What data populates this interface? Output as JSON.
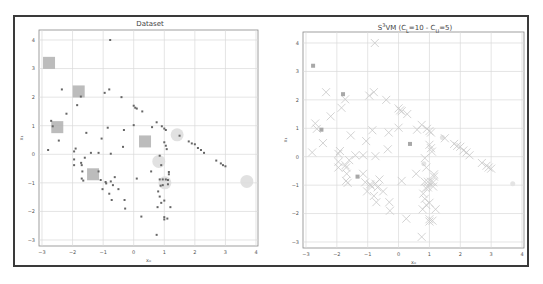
{
  "figure": {
    "frame_color": "#3a3a3a",
    "grid_color": "#d8d8d8",
    "axes_color": "#888888"
  },
  "chart_data": [
    {
      "type": "scatter",
      "title": "Dataset",
      "xlabel": "x₀",
      "ylabel": "x₁",
      "xlim": [
        -3.1,
        4.1
      ],
      "ylim": [
        -3.2,
        4.3
      ],
      "xticks": [
        -3,
        -2,
        -1,
        0,
        1,
        2,
        3,
        4
      ],
      "yticks": [
        -3,
        -2,
        -1,
        0,
        1,
        2,
        3,
        4
      ],
      "grid": true,
      "series": [
        {
          "name": "unlabeled",
          "marker": "small-dot",
          "color": "#666666",
          "points": [
            [
              -0.77,
              4.0
            ],
            [
              -2.35,
              2.27
            ],
            [
              -1.73,
              2.02
            ],
            [
              -0.95,
              2.15
            ],
            [
              -0.8,
              2.27
            ],
            [
              -0.4,
              2.0
            ],
            [
              -1.85,
              1.72
            ],
            [
              -2.2,
              1.42
            ],
            [
              -2.7,
              1.17
            ],
            [
              -2.65,
              0.98
            ],
            [
              -0.85,
              0.93
            ],
            [
              0.0,
              1.02
            ],
            [
              0.0,
              1.7
            ],
            [
              0.05,
              1.63
            ],
            [
              0.1,
              1.6
            ],
            [
              0.28,
              1.5
            ],
            [
              0.6,
              0.95
            ],
            [
              0.75,
              1.12
            ],
            [
              0.92,
              0.98
            ],
            [
              1.0,
              0.9
            ],
            [
              1.05,
              0.85
            ],
            [
              1.5,
              0.65
            ],
            [
              1.8,
              0.45
            ],
            [
              1.9,
              0.38
            ],
            [
              2.0,
              0.35
            ],
            [
              2.1,
              0.22
            ],
            [
              2.2,
              0.15
            ],
            [
              2.3,
              0.05
            ],
            [
              2.7,
              -0.22
            ],
            [
              2.85,
              -0.32
            ],
            [
              2.92,
              -0.38
            ],
            [
              3.0,
              -0.42
            ],
            [
              -2.45,
              0.48
            ],
            [
              -1.55,
              0.75
            ],
            [
              -1.05,
              0.55
            ],
            [
              -0.32,
              0.85
            ],
            [
              -0.35,
              0.26
            ],
            [
              -1.9,
              0.2
            ],
            [
              -1.95,
              0.1
            ],
            [
              -1.4,
              0.05
            ],
            [
              -1.15,
              0.05
            ],
            [
              -0.75,
              0.02
            ],
            [
              -1.6,
              -0.12
            ],
            [
              -1.95,
              -0.18
            ],
            [
              -1.95,
              -0.38
            ],
            [
              -1.72,
              -0.3
            ],
            [
              -1.7,
              -0.38
            ],
            [
              -1.68,
              -0.6
            ],
            [
              -1.15,
              -0.6
            ],
            [
              -1.08,
              -0.9
            ],
            [
              -1.7,
              -0.85
            ],
            [
              -1.65,
              -0.92
            ],
            [
              -0.92,
              -0.97
            ],
            [
              -0.9,
              -1.02
            ],
            [
              -0.75,
              -0.95
            ],
            [
              -0.68,
              -1.08
            ],
            [
              -0.62,
              -0.8
            ],
            [
              -0.5,
              -1.22
            ],
            [
              -1.02,
              -1.22
            ],
            [
              -0.8,
              -1.38
            ],
            [
              -0.72,
              -1.6
            ],
            [
              -0.3,
              -1.6
            ],
            [
              -0.28,
              -1.9
            ],
            [
              0.1,
              -0.85
            ],
            [
              0.57,
              -0.6
            ],
            [
              0.85,
              -0.05
            ],
            [
              0.9,
              -0.38
            ],
            [
              1.0,
              0.42
            ],
            [
              1.05,
              0.3
            ],
            [
              1.08,
              0.18
            ],
            [
              0.85,
              -0.88
            ],
            [
              0.95,
              -0.88
            ],
            [
              1.05,
              -0.88
            ],
            [
              0.88,
              -1.1
            ],
            [
              0.95,
              -1.08
            ],
            [
              1.12,
              -0.9
            ],
            [
              1.12,
              -1.05
            ],
            [
              1.15,
              -0.62
            ],
            [
              1.15,
              -0.7
            ],
            [
              0.8,
              -1.3
            ],
            [
              0.85,
              -1.48
            ],
            [
              0.9,
              -1.7
            ],
            [
              1.0,
              -1.62
            ],
            [
              0.78,
              -1.85
            ],
            [
              1.2,
              -1.85
            ],
            [
              0.25,
              -2.18
            ],
            [
              1.0,
              -2.2
            ],
            [
              1.0,
              -2.28
            ],
            [
              1.1,
              -2.25
            ],
            [
              0.75,
              -2.82
            ],
            [
              -2.8,
              0.15
            ]
          ]
        },
        {
          "name": "labeled-class-1",
          "marker": "square",
          "color": "#b0b0b0",
          "points": [
            [
              -2.77,
              3.2
            ],
            [
              -1.8,
              2.2
            ],
            [
              -2.5,
              0.95
            ],
            [
              -1.33,
              -0.7
            ],
            [
              0.37,
              0.45
            ]
          ]
        },
        {
          "name": "labeled-class-0",
          "marker": "circle",
          "color": "#dcdcdc",
          "points": [
            [
              1.42,
              0.68
            ],
            [
              0.82,
              -0.25
            ],
            [
              1.02,
              -1.0
            ],
            [
              3.7,
              -0.95
            ]
          ]
        }
      ]
    },
    {
      "type": "scatter",
      "title": "S³VM (C_L=10 - C_U=5)",
      "title_parts": {
        "prefix": "S",
        "sup": "3",
        "mid": "VM (C",
        "sub1": "L",
        "eq1": "=10 - C",
        "sub2": "U",
        "eq2": "=5)"
      },
      "xlabel": "x₀",
      "ylabel": "x₁",
      "xlim": [
        -3.1,
        4.1
      ],
      "ylim": [
        -3.2,
        4.3
      ],
      "xticks": [
        -3,
        -2,
        -1,
        0,
        1,
        2,
        3,
        4
      ],
      "yticks": [
        -3,
        -2,
        -1,
        0,
        1,
        2,
        3,
        4
      ],
      "grid": true,
      "series": [
        {
          "name": "predicted",
          "marker": "x",
          "color": "#c8c8c8",
          "points": "same as Dataset unlabeled"
        },
        {
          "name": "labeled",
          "marker": "small-square",
          "color": "#a8a8a8",
          "points": [
            [
              -2.77,
              3.2
            ],
            [
              -1.8,
              2.2
            ],
            [
              -2.5,
              0.95
            ],
            [
              -1.33,
              -0.7
            ],
            [
              0.37,
              0.45
            ]
          ]
        },
        {
          "name": "labeled-class-0",
          "marker": "faint-circle",
          "color": "#e4e4e4",
          "points": [
            [
              1.42,
              0.68
            ],
            [
              0.82,
              -0.25
            ],
            [
              1.02,
              -1.0
            ],
            [
              3.7,
              -0.95
            ]
          ]
        }
      ]
    }
  ]
}
